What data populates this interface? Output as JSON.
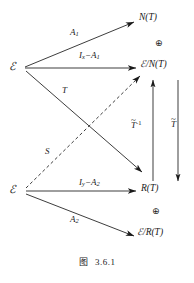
{
  "figure": {
    "caption_prefix": "图",
    "caption_number": "3.6.1",
    "background_color": "#ffffff",
    "ink_color": "#1a1a1a"
  },
  "nodes": {
    "x_space": "ℰ",
    "y_space": "ℰ",
    "n_of_t": "N(T)",
    "x_mod_n": "/N(T)",
    "r_of_t": "R(T)",
    "y_mod_r": "/R(T)"
  },
  "edges": {
    "a1": "A",
    "a1_sub": "1",
    "ix_minus_a1_head": "I",
    "ix_minus_a1_sub": "x",
    "ix_minus_a1_tail": "−A",
    "ix_minus_a1_tail_sub": "1",
    "t_map": "T",
    "s_map": "S",
    "iy_minus_a2_head": "I",
    "iy_minus_a2_sub": "y",
    "iy_minus_a2_tail": "−A",
    "iy_minus_a2_tail_sub": "2",
    "a2": "A",
    "a2_sub": "2",
    "t_tilde_inv": "T",
    "t_tilde_inv_tilde": "~",
    "t_tilde_inv_sup": "-1",
    "t_tilde": "T",
    "t_tilde_tilde": "~"
  },
  "symbols": {
    "direct_sum_top": "⊕",
    "direct_sum_bottom": "⊕"
  }
}
